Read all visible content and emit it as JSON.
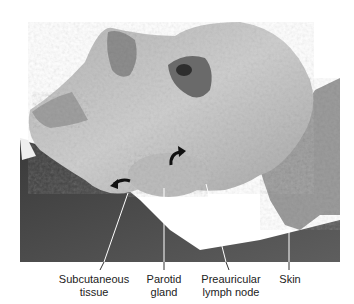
{
  "figure": {
    "labels": [
      {
        "id": "subcutaneous",
        "lines": [
          "Subcutaneous",
          "tissue"
        ],
        "x": 94,
        "pointer": [
          128,
          193
        ]
      },
      {
        "id": "parotid",
        "lines": [
          "Parotid",
          "gland"
        ],
        "x": 164,
        "pointer": [
          164,
          188
        ]
      },
      {
        "id": "preauricular",
        "lines": [
          "Preauricular",
          "lymph node"
        ],
        "x": 232,
        "pointer": [
          206,
          184
        ]
      },
      {
        "id": "skin",
        "lines": [
          "Skin"
        ],
        "x": 290,
        "pointer": [
          289,
          227
        ]
      }
    ],
    "arrows": [
      "curved-arrow-left",
      "curved-arrow-right"
    ]
  },
  "colors": {
    "background": "#ffffff",
    "skin_light": "#c8c8c8",
    "tissue_mid": "#9a9a9a",
    "tissue_dark": "#4a4a4a",
    "label_text": "#222222",
    "leader_line": "#ffffff"
  }
}
